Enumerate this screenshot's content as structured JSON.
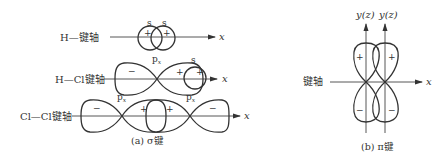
{
  "figure": {
    "sigma": {
      "caption": "(a) σ键",
      "hh": {
        "axis_label": "H—键轴",
        "orbitals": [
          "s",
          "s"
        ],
        "signs": [
          "+",
          "+"
        ],
        "x_label": "x"
      },
      "hcl": {
        "axis_label": "H—Cl键轴",
        "orbitals": [
          "px",
          "s"
        ],
        "px_main": "p",
        "px_sub": "x",
        "signs": [
          "−",
          "+",
          "+"
        ],
        "x_label": "x"
      },
      "clcl": {
        "axis_label": "Cl—Cl键轴",
        "px_main": "p",
        "px_sub": "x",
        "signs": [
          "−",
          "+",
          "+",
          "−"
        ],
        "x_label": "x"
      }
    },
    "pi": {
      "caption": "(b) π键",
      "axis_label": "键轴",
      "y_labels": [
        "y(z)",
        "y(z)"
      ],
      "signs": [
        "+",
        "+",
        "−",
        "−"
      ],
      "x_label": "x"
    }
  }
}
